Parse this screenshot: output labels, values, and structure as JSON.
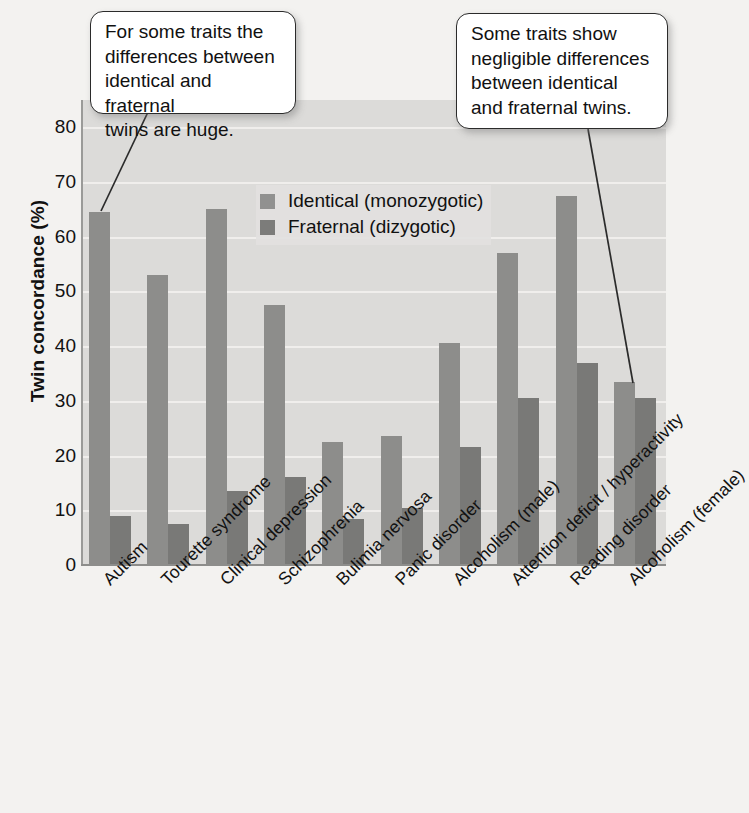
{
  "chart_data": {
    "type": "bar",
    "title": "",
    "xlabel": "",
    "ylabel": "Twin concordance (%)",
    "ylim": [
      0,
      85
    ],
    "yticks": [
      0,
      10,
      20,
      30,
      40,
      50,
      60,
      70,
      80
    ],
    "grid": true,
    "legend_position": "upper-center",
    "categories": [
      "Autism",
      "Tourette syndrome",
      "Clinical depression",
      "Schizophrenia",
      "Bulimia nervosa",
      "Panic disorder",
      "Alcoholism (male)",
      "Attention deficit / hyperactivity",
      "Reading disorder",
      "Alcoholism (female)"
    ],
    "series": [
      {
        "name": "Identical (monozygotic)",
        "color": "#8d8d8b",
        "values": [
          64.5,
          53,
          65,
          47.5,
          22.5,
          23.5,
          40.5,
          57,
          67.5,
          33.5
        ]
      },
      {
        "name": "Fraternal (dizygotic)",
        "color": "#797977",
        "values": [
          9,
          7.5,
          13.5,
          16,
          8.5,
          10.5,
          21.5,
          30.5,
          37,
          30.5
        ]
      }
    ],
    "annotations": [
      {
        "id": "callout-left",
        "text": "For some traits the differences between identical and fraternal twins are huge.",
        "points_to": "Autism"
      },
      {
        "id": "callout-right",
        "text": "Some traits show negligible differences between identical and fraternal twins.",
        "points_to": "Alcoholism (female)"
      }
    ]
  },
  "legend": {
    "items": [
      {
        "label": "Identical (monozygotic)",
        "swatch": "identical"
      },
      {
        "label": "Fraternal (dizygotic)",
        "swatch": "fraternal"
      }
    ]
  },
  "callouts": {
    "left": {
      "line1": "For some traits the",
      "line2": "differences between",
      "line3": "identical and fraternal",
      "line4": "twins are huge."
    },
    "right": {
      "line1": "Some traits show",
      "line2": "negligible differences",
      "line3": "between identical",
      "line4": "and fraternal twins."
    }
  },
  "colors": {
    "identical_bar": "#8d8d8b",
    "fraternal_bar": "#797977",
    "plot_background": "#dcdbd9",
    "page_background": "#f3f2f0",
    "gridline": "#f0efed",
    "text": "#111111"
  }
}
